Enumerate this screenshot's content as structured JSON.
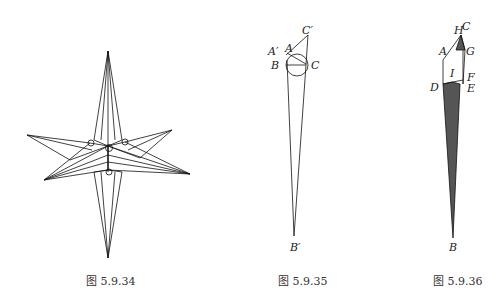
{
  "figures": [
    {
      "caption": "图 5.9.34",
      "description": "four-pointed star polyhedron with layered folded facets"
    },
    {
      "caption": "图 5.9.35",
      "labels": {
        "C_prime": "C′",
        "A_prime": "A′",
        "A": "A",
        "B": "B",
        "C": "C",
        "B_prime": "B′"
      }
    },
    {
      "caption": "图 5.9.36",
      "labels": {
        "H": "H",
        "C": "C",
        "A": "A",
        "G": "G",
        "I": "I",
        "F": "F",
        "D": "D",
        "E": "E",
        "B": "B"
      },
      "fill_color": "#555555"
    }
  ]
}
